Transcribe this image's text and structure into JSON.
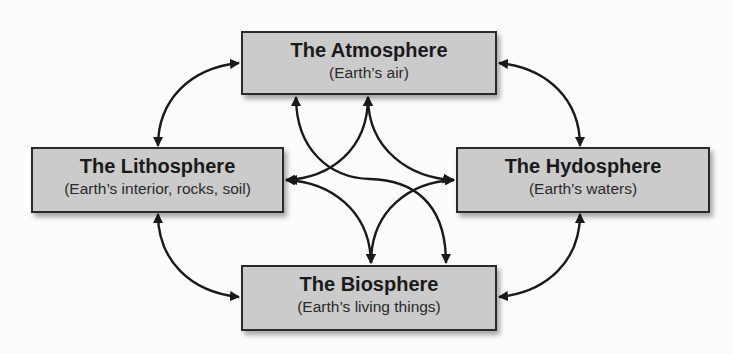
{
  "diagram": {
    "colors": {
      "background": "#fcfcfc",
      "box_fill": "#cbcbcb",
      "box_border": "#2a2a2a",
      "arrow": "#1a1a1a"
    },
    "nodes": {
      "atmosphere": {
        "title": "The Atmosphere",
        "subtitle": "(Earth’s air)"
      },
      "lithosphere": {
        "title": "The Lithosphere",
        "subtitle": "(Earth’s interior, rocks, soil)"
      },
      "hydrosphere": {
        "title": "The Hydosphere",
        "subtitle": "(Earth’s waters)"
      },
      "biosphere": {
        "title": "The Biosphere",
        "subtitle": "(Earth’s living things)"
      }
    },
    "connections": [
      {
        "from": "atmosphere",
        "to": "lithosphere",
        "type": "bidirectional"
      },
      {
        "from": "atmosphere",
        "to": "hydrosphere",
        "type": "bidirectional"
      },
      {
        "from": "lithosphere",
        "to": "biosphere",
        "type": "bidirectional"
      },
      {
        "from": "hydrosphere",
        "to": "biosphere",
        "type": "bidirectional"
      },
      {
        "from": "atmosphere",
        "to": "biosphere",
        "type": "bidirectional"
      },
      {
        "from": "lithosphere",
        "to": "hydrosphere",
        "type": "bidirectional"
      }
    ]
  }
}
